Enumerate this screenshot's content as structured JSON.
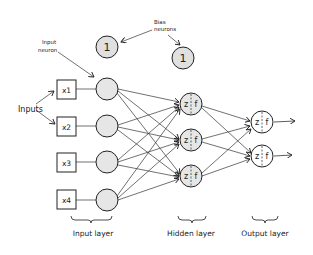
{
  "diagram": {
    "type": "neural-network",
    "annotations": {
      "input_neuron": [
        "Input",
        "neuron"
      ],
      "bias_neurons": [
        "Bias",
        "neurons"
      ],
      "inputs": "Inputs"
    },
    "inputs": [
      "x1",
      "x2",
      "x3",
      "x4"
    ],
    "bias_label": "1",
    "hidden_node": {
      "left": "z",
      "right": "f"
    },
    "output_node": {
      "left": "z",
      "right": "f"
    },
    "layer_labels": {
      "input": "Input layer",
      "hidden": "Hidden layer",
      "output": "Output layer"
    },
    "colors": {
      "stroke": "#222222",
      "neuron_fill": "#e6e6e6",
      "output_fill": "#ffffff"
    }
  }
}
